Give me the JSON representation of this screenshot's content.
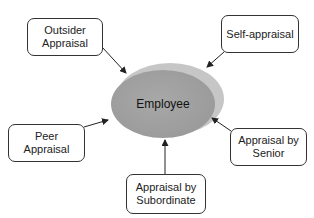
{
  "center": {
    "label": "Employee"
  },
  "nodes": [
    {
      "id": "outsider",
      "label": "Outsider Appraisal"
    },
    {
      "id": "self",
      "label": "Self-appraisal"
    },
    {
      "id": "peer",
      "label": "Peer Appraisal"
    },
    {
      "id": "subordinate",
      "label": "Appraisal by Subordinate"
    },
    {
      "id": "senior",
      "label": "Appraisal by Senior"
    }
  ],
  "colors": {
    "ellipse_fill": "#a3a3a3",
    "ellipse_side": "#c4c4c4",
    "stroke": "#333333",
    "background": "#ffffff"
  }
}
